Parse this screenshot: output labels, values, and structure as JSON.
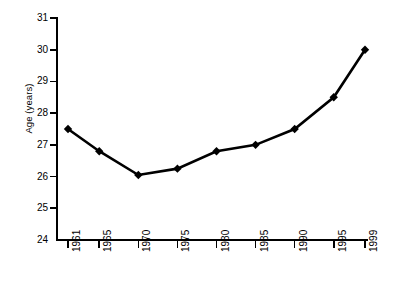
{
  "chart_data": {
    "type": "line",
    "title": "",
    "xlabel": "",
    "ylabel": "Age (years)",
    "x": [
      1961,
      1965,
      1970,
      1975,
      1980,
      1985,
      1990,
      1995,
      1999
    ],
    "categories": [
      "1961",
      "1965",
      "1970",
      "1975",
      "1980",
      "1985",
      "1990",
      "1995",
      "1999"
    ],
    "values": [
      27.5,
      26.8,
      26.05,
      26.25,
      26.8,
      27.0,
      27.5,
      28.5,
      30.0
    ],
    "series": [
      {
        "name": "Age (years)",
        "values": [
          27.5,
          26.8,
          26.05,
          26.25,
          26.8,
          27.0,
          27.5,
          28.5,
          30.0
        ]
      }
    ],
    "ylim": [
      24,
      31
    ],
    "yticks": [
      24,
      25,
      26,
      27,
      28,
      29,
      30,
      31
    ],
    "ytick_labels": [
      "24",
      "25",
      "26",
      "27",
      "28",
      "29",
      "30",
      "31"
    ],
    "xtick_labels": [
      "1961",
      "1965",
      "1970",
      "1975",
      "1980",
      "1985",
      "1990",
      "1995",
      "1999"
    ],
    "xtick_label_rotation": 90,
    "grid": false,
    "legend": false,
    "legend_position": "none",
    "marker": "diamond",
    "line_color": "#000000",
    "marker_color": "#000000",
    "background_color": "#ffffff",
    "axis_color": "#000000",
    "spines": [
      "left",
      "bottom"
    ]
  },
  "bottom_caption": ""
}
